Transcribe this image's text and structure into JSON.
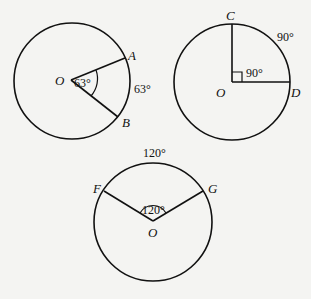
{
  "figures": [
    {
      "id": "circle-63",
      "center_label": "O",
      "points": [
        {
          "label": "A"
        },
        {
          "label": "B"
        }
      ],
      "central_angle_label": "63°",
      "arc_label": "63°"
    },
    {
      "id": "circle-90",
      "center_label": "O",
      "points": [
        {
          "label": "C"
        },
        {
          "label": "D"
        }
      ],
      "central_angle_label": "90°",
      "arc_label": "90°"
    },
    {
      "id": "circle-120",
      "center_label": "O",
      "points": [
        {
          "label": "F"
        },
        {
          "label": "G"
        }
      ],
      "central_angle_label": "120°",
      "arc_label": "120°"
    }
  ]
}
